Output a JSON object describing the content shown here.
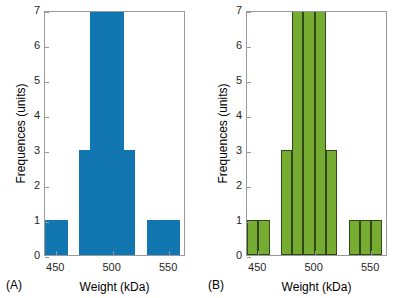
{
  "figure": {
    "background": "#ffffff",
    "axis_color": "#9a9a9a",
    "text_color": "#000000"
  },
  "panels": [
    {
      "key": "A",
      "label": "(A)",
      "bar_color": "#1277b0",
      "bar_edge_color": "#1277b0",
      "xlabel": "Weight (kDa)",
      "ylabel": "Frequences (units)",
      "xticklabels": [
        "450",
        "500",
        "550"
      ],
      "yticklabels": [
        "0",
        "1",
        "2",
        "3",
        "4",
        "5",
        "6",
        "7"
      ]
    },
    {
      "key": "B",
      "label": "(B)",
      "bar_color": "#76ac32",
      "bar_edge_color": "#31471a",
      "xlabel": "Weight (kDa)",
      "ylabel": "Frequences (units)",
      "xticklabels": [
        "450",
        "500",
        "550"
      ],
      "yticklabels": [
        "0",
        "1",
        "2",
        "3",
        "4",
        "5",
        "6",
        "7"
      ]
    }
  ],
  "chart_data": [
    {
      "type": "bar",
      "panel": "A",
      "title": "(A)",
      "xlabel": "Weight (kDa)",
      "ylabel": "Frequences (units)",
      "xlim": [
        440,
        565
      ],
      "ylim": [
        0,
        7
      ],
      "xticks": [
        450,
        500,
        550
      ],
      "yticks": [
        0,
        1,
        2,
        3,
        4,
        5,
        6,
        7
      ],
      "grid": false,
      "legend": null,
      "bin_width": 10,
      "bin_centers": [
        445,
        455,
        475,
        485,
        495,
        505,
        515,
        535,
        545,
        555
      ],
      "categories": [
        "445",
        "455",
        "475",
        "485",
        "495",
        "505",
        "515",
        "535",
        "545",
        "555"
      ],
      "values": [
        1,
        1,
        3,
        7,
        7,
        7,
        3,
        1,
        1,
        1
      ],
      "color": "#1277b0"
    },
    {
      "type": "bar",
      "panel": "B",
      "title": "(B)",
      "xlabel": "Weight (kDa)",
      "ylabel": "Frequences (units)",
      "xlim": [
        440,
        565
      ],
      "ylim": [
        0,
        7
      ],
      "xticks": [
        450,
        500,
        550
      ],
      "yticks": [
        0,
        1,
        2,
        3,
        4,
        5,
        6,
        7
      ],
      "grid": false,
      "legend": null,
      "bin_width": 10,
      "bin_centers": [
        445,
        455,
        475,
        485,
        495,
        505,
        515,
        535,
        545,
        555
      ],
      "categories": [
        "445",
        "455",
        "475",
        "485",
        "495",
        "505",
        "515",
        "535",
        "545",
        "555"
      ],
      "values": [
        1,
        1,
        3,
        7,
        7,
        7,
        3,
        1,
        1,
        1
      ],
      "color": "#76ac32"
    }
  ]
}
